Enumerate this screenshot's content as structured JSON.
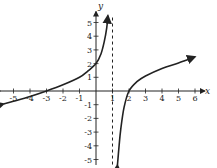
{
  "chart_data": {
    "type": "line",
    "title": "",
    "xlabel": "x",
    "ylabel": "y",
    "xlim": [
      -5.8,
      6.6
    ],
    "ylim": [
      -5.4,
      5.8
    ],
    "x_ticks": [
      -5,
      -4,
      -3,
      -2,
      -1,
      1,
      2,
      3,
      4,
      5,
      6
    ],
    "y_ticks": [
      -5,
      -4,
      -3,
      -2,
      -1,
      1,
      2,
      3,
      4,
      5
    ],
    "grid": false,
    "asymptotes": [
      {
        "type": "vertical",
        "x": 1,
        "style": "dashed"
      }
    ],
    "series": [
      {
        "name": "left branch",
        "points": [
          [
            -5.6,
            -0.95
          ],
          [
            -5,
            -0.75
          ],
          [
            -4,
            -0.4
          ],
          [
            -3,
            0
          ],
          [
            -2,
            0.45
          ],
          [
            -1,
            1.0
          ],
          [
            -0.5,
            1.45
          ],
          [
            0,
            2
          ],
          [
            0.3,
            2.7
          ],
          [
            0.5,
            3.6
          ],
          [
            0.65,
            4.6
          ],
          [
            0.72,
            5.5
          ]
        ],
        "arrows": "both"
      },
      {
        "name": "right branch",
        "points": [
          [
            1.3,
            -5.4
          ],
          [
            1.4,
            -4.0
          ],
          [
            1.5,
            -2.8
          ],
          [
            1.7,
            -1.2
          ],
          [
            2,
            0
          ],
          [
            2.5,
            0.7
          ],
          [
            3,
            1.1
          ],
          [
            4,
            1.65
          ],
          [
            5,
            2.05
          ],
          [
            6,
            2.5
          ]
        ],
        "arrows": "both"
      }
    ],
    "key_points": [
      [
        -3,
        0
      ],
      [
        0,
        2
      ],
      [
        2,
        0
      ]
    ]
  },
  "labels": {
    "x_axis": "x",
    "y_axis": "y"
  }
}
